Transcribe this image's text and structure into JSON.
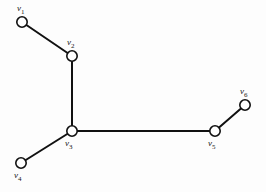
{
  "figure": {
    "background_color": "#fdfdfd",
    "stroke_color": "#111111",
    "node_fill_color": "#ffffff",
    "label_color": "#161616",
    "width": 266,
    "height": 192
  },
  "chart_data": {
    "type": "diagram",
    "diagram_kind": "undirected-graph-tree",
    "title": "",
    "xlabel": "",
    "ylabel": "",
    "grid": false,
    "legend": null,
    "node_radius": 5.2,
    "nodes": [
      {
        "id": "v1",
        "label_base": "v",
        "label_sub": "1",
        "x": 22,
        "y": 22,
        "label_x": 17,
        "label_y": 4,
        "degree": 1
      },
      {
        "id": "v2",
        "label_base": "v",
        "label_sub": "2",
        "x": 72,
        "y": 56,
        "label_x": 67,
        "label_y": 38,
        "degree": 2
      },
      {
        "id": "v3",
        "label_base": "v",
        "label_sub": "3",
        "x": 72,
        "y": 131,
        "label_x": 65,
        "label_y": 139,
        "degree": 3
      },
      {
        "id": "v4",
        "label_base": "v",
        "label_sub": "4",
        "x": 21,
        "y": 163,
        "label_x": 14,
        "label_y": 171,
        "degree": 1
      },
      {
        "id": "v5",
        "label_base": "v",
        "label_sub": "5",
        "x": 215,
        "y": 131,
        "label_x": 208,
        "label_y": 139,
        "degree": 2
      },
      {
        "id": "v6",
        "label_base": "v",
        "label_sub": "6",
        "x": 245,
        "y": 105,
        "label_x": 240,
        "label_y": 87,
        "degree": 1
      }
    ],
    "edges": [
      {
        "source": "v1",
        "target": "v2"
      },
      {
        "source": "v2",
        "target": "v3"
      },
      {
        "source": "v3",
        "target": "v4"
      },
      {
        "source": "v3",
        "target": "v5"
      },
      {
        "source": "v5",
        "target": "v6"
      }
    ],
    "node_count": 6,
    "edge_count": 5
  }
}
